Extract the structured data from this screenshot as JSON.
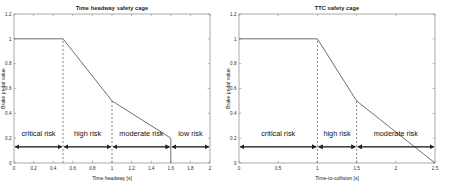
{
  "figure": {
    "background": "#ffffff",
    "axis_color": "#9a9a9a",
    "curve_color": "#555555",
    "dash_color": "#777777",
    "arrow_color": "#222222"
  },
  "chart_data": [
    {
      "type": "line",
      "id": "time-headway-safety-cage",
      "title": "Time headway safety cage",
      "xlabel": "Time headway [s]",
      "ylabel": "Brake pedal value",
      "xlim": [
        0,
        2
      ],
      "ylim": [
        0,
        1.2
      ],
      "grid": false,
      "legend": "none",
      "xticks": [
        0,
        0.2,
        0.4,
        0.6,
        0.8,
        1,
        1.2,
        1.4,
        1.6,
        1.8,
        2
      ],
      "xticklabels": [
        "0",
        "0.2",
        "0.4",
        "0.6",
        "0.8",
        "1",
        "1.2",
        "1.4",
        "1.6",
        "1.8",
        "2"
      ],
      "yticks": [
        0,
        0.2,
        0.4,
        0.6,
        0.8,
        1,
        1.2
      ],
      "yticklabels": [
        "0",
        "0.2",
        "0.4",
        "0.6",
        "0.8",
        "1",
        "1.2"
      ],
      "series": [
        {
          "name": "brake pedal value",
          "x": [
            0,
            0.5,
            1.0,
            1.6,
            1.6
          ],
          "y": [
            1.0,
            1.0,
            0.5,
            0.2,
            0.0
          ]
        }
      ],
      "vertical_markers": [
        {
          "x": 0.5,
          "y_from": 0.0,
          "y_to": 1.0,
          "style": "dashed"
        },
        {
          "x": 1.0,
          "y_from": 0.0,
          "y_to": 0.5,
          "style": "dashed"
        }
      ],
      "regions": [
        {
          "label": "critical risk",
          "x_from": 0,
          "x_to": 0.5
        },
        {
          "label": "high risk",
          "x_from": 0.5,
          "x_to": 1.0
        },
        {
          "label": "moderate risk",
          "x_from": 1.0,
          "x_to": 1.6
        },
        {
          "label": "low risk",
          "x_from": 1.6,
          "x_to": 2.0
        }
      ],
      "region_band_y": 0.13,
      "region_label_y": 0.22
    },
    {
      "type": "line",
      "id": "ttc-safety-cage",
      "title": "TTC safety cage",
      "xlabel": "Time-to-collision [s]",
      "ylabel": "Brake pedal value",
      "xlim": [
        0,
        2.5
      ],
      "ylim": [
        0,
        1.2
      ],
      "grid": false,
      "legend": "none",
      "xticks": [
        0,
        0.5,
        1,
        1.5,
        2,
        2.5
      ],
      "xticklabels": [
        "0",
        "0.5",
        "1",
        "1.5",
        "2",
        "2.5"
      ],
      "yticks": [
        0,
        0.2,
        0.4,
        0.6,
        0.8,
        1,
        1.2
      ],
      "yticklabels": [
        "0",
        "0.2",
        "0.4",
        "0.6",
        "0.8",
        "1",
        "1.2"
      ],
      "series": [
        {
          "name": "brake pedal value",
          "x": [
            0,
            1.0,
            1.5,
            2.5
          ],
          "y": [
            1.0,
            1.0,
            0.5,
            0.0
          ]
        }
      ],
      "vertical_markers": [
        {
          "x": 1.0,
          "y_from": 0.0,
          "y_to": 1.0,
          "style": "dashed"
        },
        {
          "x": 1.5,
          "y_from": 0.0,
          "y_to": 0.5,
          "style": "dashed"
        }
      ],
      "regions": [
        {
          "label": "critical risk",
          "x_from": 0,
          "x_to": 1.0
        },
        {
          "label": "high risk",
          "x_from": 1.0,
          "x_to": 1.5
        },
        {
          "label": "moderate risk",
          "x_from": 1.5,
          "x_to": 2.5
        }
      ],
      "region_band_y": 0.13,
      "region_label_y": 0.22
    }
  ]
}
